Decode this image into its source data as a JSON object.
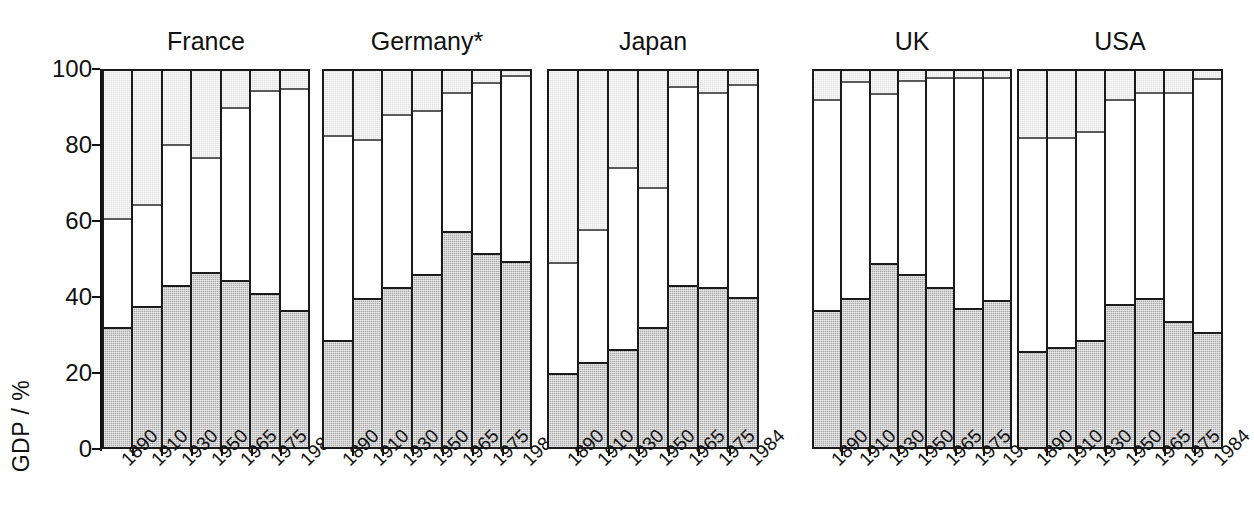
{
  "chart_data": {
    "type": "bar",
    "subtype": "stacked-percentage, small-multiples",
    "title": "",
    "xlabel": "",
    "ylabel": "GDP / %",
    "ylim": [
      0,
      100
    ],
    "yticks": [
      0,
      20,
      40,
      60,
      80,
      100
    ],
    "grid": false,
    "legend": "none",
    "categories": [
      "1890",
      "1910",
      "1930",
      "1950",
      "1965",
      "1975",
      "1984"
    ],
    "series_names": [
      "Agriculture (dark)",
      "Industry (white)",
      "Services (light)"
    ],
    "annotations": [
      "* Germany"
    ],
    "panels": [
      {
        "name": "France",
        "label": "France",
        "agriculture": [
          32,
          37.5,
          43,
          46.5,
          44.5,
          41,
          36.5
        ],
        "industry": [
          28.5,
          26.5,
          37,
          30,
          45.5,
          53.5,
          58.5
        ],
        "services": [
          39.5,
          36,
          20,
          23.5,
          10,
          5.5,
          5
        ]
      },
      {
        "name": "Germany",
        "label": "Germany*",
        "agriculture": [
          28.5,
          39.5,
          42.5,
          46,
          57.5,
          51.5,
          49.5
        ],
        "industry": [
          54,
          42,
          45.5,
          43,
          36.5,
          45,
          49
        ],
        "services": [
          17.5,
          18.5,
          12,
          11,
          6,
          3.5,
          1.5
        ]
      },
      {
        "name": "Japan",
        "label": "Japan",
        "agriculture": [
          19.7,
          22.5,
          26,
          32,
          43,
          42.5,
          40
        ],
        "industry": [
          29,
          35,
          48,
          36.5,
          52.5,
          51.5,
          56
        ],
        "services": [
          51.3,
          42.5,
          26,
          31.5,
          4.5,
          6,
          4
        ]
      },
      {
        "name": "UK",
        "label": "UK",
        "agriculture": [
          36.5,
          39.5,
          49,
          46,
          42.5,
          37,
          39
        ],
        "industry": [
          55.5,
          57.2,
          44.5,
          51,
          55.5,
          61,
          59
        ],
        "services": [
          8,
          3.3,
          6.5,
          3,
          2,
          2,
          2
        ]
      },
      {
        "name": "USA",
        "label": "USA",
        "agriculture": [
          25.5,
          26.5,
          28.5,
          38,
          39.5,
          33.5,
          30.5
        ],
        "industry": [
          56.5,
          55.5,
          55,
          54,
          54.5,
          60.5,
          67
        ],
        "services": [
          18,
          18,
          16.5,
          8,
          6,
          6,
          2.5
        ]
      }
    ]
  },
  "axis": {
    "y_title": "GDP / %",
    "y_ticks": [
      "0",
      "20",
      "40",
      "60",
      "80",
      "100"
    ]
  },
  "colors": {
    "agriculture": "#a8a8a8",
    "industry": "#ffffff",
    "services": "#e3e3e3",
    "outline": "#1a1a1a",
    "background": "#ffffff"
  }
}
